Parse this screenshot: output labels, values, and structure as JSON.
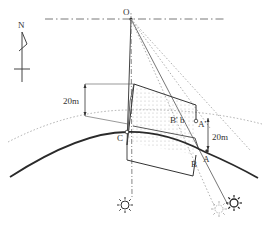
{
  "diagram": {
    "type": "sun-shadow-geometry",
    "compass": {
      "label": "N"
    },
    "points": {
      "O": "O",
      "A": "A",
      "A_prime": "A'",
      "B": "B",
      "B_prime": "B'",
      "b": "b",
      "C": "C"
    },
    "dimensions": {
      "left_height": "20m",
      "right_height": "20m"
    },
    "icons": [
      "sun-icon",
      "sun-icon",
      "sun-icon-faded"
    ],
    "colors": {
      "ink": "#333333",
      "ground_curve": "#2a2a2a",
      "dotted": "#888888",
      "fill_dots": "#bdbdbd"
    }
  }
}
